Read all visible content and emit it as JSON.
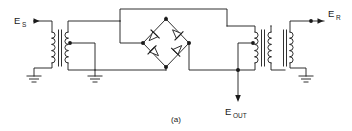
{
  "figure": {
    "caption": "(a)",
    "type": "schematic-diagram",
    "line_color": "#1a1a1a",
    "background_color": "#ffffff"
  },
  "labels": {
    "source": {
      "base": "E",
      "sub": "S"
    },
    "output": {
      "base": "E",
      "sub": "OUT"
    },
    "reference": {
      "base": "E",
      "sub": "R"
    }
  },
  "components": {
    "transformers": [
      {
        "id": "T1",
        "name": "input-transformer",
        "side": "left"
      },
      {
        "id": "T2",
        "name": "bridge-drive-transformer",
        "side": "left-center"
      },
      {
        "id": "T3",
        "name": "output-transformer",
        "side": "right-center"
      },
      {
        "id": "T4",
        "name": "reference-transformer",
        "side": "right"
      }
    ],
    "diodes": [
      {
        "id": "D1",
        "name": "diode-top-left",
        "direction": "up-right"
      },
      {
        "id": "D2",
        "name": "diode-top-right",
        "direction": "down-right"
      },
      {
        "id": "D3",
        "name": "diode-bottom-left",
        "direction": "up-left"
      },
      {
        "id": "D4",
        "name": "diode-bottom-right",
        "direction": "down-left"
      }
    ],
    "grounds": [
      {
        "id": "G1",
        "name": "ground-input-primary"
      },
      {
        "id": "G2",
        "name": "ground-secondary-centertap"
      },
      {
        "id": "G3",
        "name": "ground-reference-primary"
      }
    ],
    "junction_dots": 9,
    "arrow_terminals": [
      {
        "name": "source-input-arrow",
        "points": "right"
      },
      {
        "name": "output-arrow",
        "points": "down"
      },
      {
        "name": "reference-input-arrow",
        "points": "right"
      }
    ]
  }
}
